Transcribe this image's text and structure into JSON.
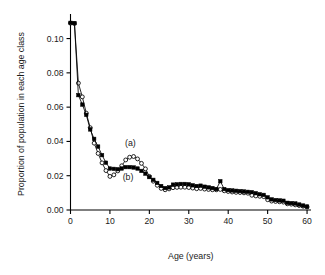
{
  "chart_data": {
    "type": "line",
    "title": "",
    "xlabel": "Age (years)",
    "ylabel": "Proportion of population in each age class",
    "xlim": [
      0,
      61
    ],
    "ylim": [
      0,
      0.112
    ],
    "xticks": [
      0,
      10,
      20,
      30,
      40,
      50,
      60
    ],
    "xticklabels": [
      "0",
      "10",
      "20",
      "30",
      "40",
      "50",
      "60"
    ],
    "yticks": [
      0.0,
      0.02,
      0.04,
      0.06,
      0.08,
      0.1
    ],
    "yticklabels": [
      "0.00",
      "0.02",
      "0.04",
      "0.06",
      "0.08",
      "0.10"
    ],
    "grid": false,
    "legend_position": "inline-annotation",
    "annotations": [
      {
        "text": "(a)",
        "x": 15.2,
        "y": 0.0375,
        "series": "a"
      },
      {
        "text": "(b)",
        "x": 14.6,
        "y": 0.0175,
        "series": "b"
      }
    ],
    "series": [
      {
        "name": "(a)",
        "marker": "open-circle",
        "marker_color": "#ffffff",
        "line_color": "#000000",
        "x": [
          0,
          1,
          2,
          3,
          4,
          5,
          6,
          7,
          8,
          9,
          10,
          11,
          12,
          13,
          14,
          15,
          16,
          17,
          18,
          19,
          20,
          21,
          22,
          23,
          24,
          25,
          26,
          27,
          28,
          29,
          30,
          31,
          32,
          33,
          34,
          35,
          36,
          37,
          38,
          39,
          40,
          41,
          42,
          43,
          44,
          45,
          46,
          47,
          48,
          49,
          50,
          51,
          52,
          53,
          54,
          55,
          56,
          57,
          58,
          59,
          60
        ],
        "values": [
          0.109,
          0.1088,
          0.074,
          0.066,
          0.0565,
          0.048,
          0.039,
          0.033,
          0.0275,
          0.023,
          0.0196,
          0.0205,
          0.0228,
          0.0258,
          0.0292,
          0.0308,
          0.0312,
          0.0298,
          0.0272,
          0.024,
          0.0196,
          0.0168,
          0.0144,
          0.0126,
          0.0118,
          0.0123,
          0.013,
          0.0132,
          0.0133,
          0.0133,
          0.0131,
          0.0128,
          0.0124,
          0.0126,
          0.0122,
          0.012,
          0.0118,
          0.0118,
          0.012,
          0.0112,
          0.0108,
          0.0105,
          0.0103,
          0.0102,
          0.01,
          0.0098,
          0.0086,
          0.0082,
          0.008,
          0.0078,
          0.006,
          0.0052,
          0.005,
          0.0048,
          0.0046,
          0.0036,
          0.0034,
          0.003,
          0.0026,
          0.0022,
          0.0018
        ]
      },
      {
        "name": "(b)",
        "marker": "filled-square",
        "marker_color": "#000000",
        "line_color": "#000000",
        "x": [
          0,
          1,
          2,
          3,
          4,
          5,
          6,
          7,
          8,
          9,
          10,
          11,
          12,
          13,
          14,
          15,
          16,
          17,
          18,
          19,
          20,
          21,
          22,
          23,
          24,
          25,
          26,
          27,
          28,
          29,
          30,
          31,
          32,
          33,
          34,
          35,
          36,
          37,
          38,
          39,
          40,
          41,
          42,
          43,
          44,
          45,
          46,
          47,
          48,
          49,
          50,
          51,
          52,
          53,
          54,
          55,
          56,
          57,
          58,
          59,
          60
        ],
        "values": [
          0.1092,
          0.109,
          0.067,
          0.0615,
          0.0555,
          0.047,
          0.0415,
          0.037,
          0.032,
          0.0276,
          0.0242,
          0.024,
          0.0238,
          0.0242,
          0.025,
          0.025,
          0.0248,
          0.0242,
          0.0228,
          0.0212,
          0.0192,
          0.0176,
          0.0158,
          0.014,
          0.0128,
          0.0132,
          0.0148,
          0.015,
          0.0152,
          0.0152,
          0.015,
          0.0144,
          0.014,
          0.0142,
          0.0136,
          0.0132,
          0.0128,
          0.0122,
          0.0168,
          0.0122,
          0.0116,
          0.0114,
          0.0112,
          0.011,
          0.0108,
          0.0106,
          0.0104,
          0.0098,
          0.0092,
          0.0088,
          0.0074,
          0.0062,
          0.0058,
          0.0056,
          0.0054,
          0.0042,
          0.004,
          0.0038,
          0.0032,
          0.0026,
          0.002
        ]
      }
    ]
  }
}
